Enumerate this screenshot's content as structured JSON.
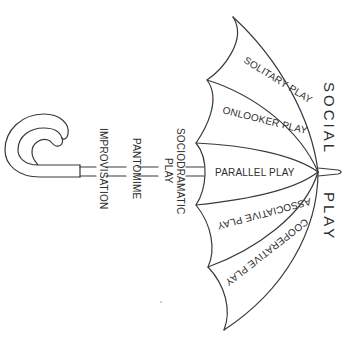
{
  "diagram": {
    "title": "SOCIAL PLAY",
    "title_parts": [
      "SOCIAL",
      "PLAY"
    ],
    "canopy_panels": [
      {
        "label": "SOLITARY PLAY"
      },
      {
        "label": "ONLOOKER PLAY"
      },
      {
        "label": "PARALLEL PLAY"
      },
      {
        "label": "ASSOCIATIVE PLAY"
      },
      {
        "label": "COOPERATIVE PLAY"
      }
    ],
    "shaft_labels": [
      {
        "label": "SOCIODRAMATIC",
        "label2": "PLAY"
      },
      {
        "label": "PANTOMIME"
      },
      {
        "label": "IMPROVISATION"
      }
    ],
    "line_color": "#3a3a3a",
    "background": "#ffffff"
  }
}
